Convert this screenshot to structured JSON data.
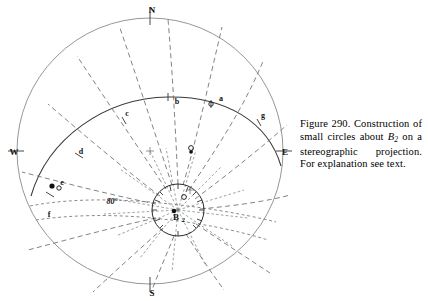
{
  "figure": {
    "caption": {
      "prefix": "Figure 290. Construction of small circles about ",
      "symbol": "B",
      "symbol_sub": "2",
      "suffix": " on a stereographic projection. For explanation see text.",
      "full_text": "Figure 290. Construction of small circles about B2 on a stereographic projection. For explanation see text.",
      "number": "Figure 290."
    },
    "diagram_type": "stereographic-projection-net",
    "primitive_circle": {
      "center_x": 150,
      "center_y": 151,
      "radius": 133,
      "color": "#8a8a8a"
    },
    "small_circle": {
      "center_x": 178,
      "center_y": 210,
      "radius": 26,
      "color": "#2a2a2a"
    },
    "cardinal_labels": [
      {
        "text": "N",
        "x": 152,
        "y": 13
      },
      {
        "text": "E",
        "x": 285,
        "y": 155
      },
      {
        "text": "S",
        "x": 152,
        "y": 296
      },
      {
        "text": "W",
        "x": 14,
        "y": 155
      }
    ],
    "point_labels": [
      {
        "text": "a",
        "x": 221,
        "y": 101
      },
      {
        "text": "b",
        "x": 177,
        "y": 104
      },
      {
        "text": "c",
        "x": 127,
        "y": 116
      },
      {
        "text": "d",
        "x": 81,
        "y": 154
      },
      {
        "text": "e",
        "x": 62,
        "y": 185
      },
      {
        "text": "f",
        "x": 49,
        "y": 217
      },
      {
        "text": "g",
        "x": 263,
        "y": 118
      }
    ],
    "angle_label": {
      "text": "80°",
      "x": 112,
      "y": 204
    },
    "center_label": {
      "text": "B",
      "sub": "2",
      "x": 176,
      "y": 220
    },
    "marked_points": [
      {
        "name": "pole-marker-upper-right",
        "x": 192,
        "y": 148,
        "style": "open-dot"
      },
      {
        "name": "pole-marker-left-edge",
        "x": 53,
        "y": 186,
        "style": "filled-dot"
      },
      {
        "name": "pole-marker-upper-arc",
        "x": 211,
        "y": 106,
        "style": "open-dot"
      },
      {
        "name": "pole-marker-inner",
        "x": 184,
        "y": 198,
        "style": "open-dot"
      }
    ],
    "net_center_mark": {
      "x": 150,
      "y": 151
    },
    "colors": {
      "primitive": "#8a8a8a",
      "great_circle": "#3a3a3a",
      "dashed": "#6d6d6d",
      "text": "#111111",
      "background": "#ffffff"
    }
  }
}
